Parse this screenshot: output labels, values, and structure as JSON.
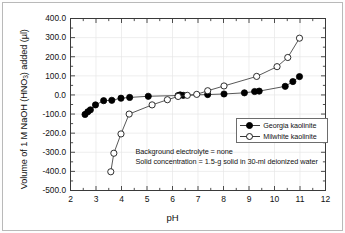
{
  "chart_data": {
    "type": "line",
    "title": "",
    "xlabel": "pH",
    "ylabel": "Volume of 1 M NaOH (HNO3) added (µl)",
    "ylabel_parts": {
      "pre": "Volume of 1 M NaOH (HNO",
      "sub": "3",
      "post": ") added (µl)"
    },
    "xlim": [
      2,
      12
    ],
    "ylim": [
      -500,
      400
    ],
    "xticks": [
      "2",
      "3",
      "4",
      "5",
      "6",
      "7",
      "8",
      "9",
      "10",
      "11",
      "12"
    ],
    "yticks": [
      "400.0",
      "300.0",
      "200.0",
      "100.0",
      "0.0",
      "-100.0",
      "-200.0",
      "-300.0",
      "-400.0",
      "-500.0"
    ],
    "grid": true,
    "legend_position": "center-right",
    "series": [
      {
        "name": "Georgia kaolinite",
        "marker": "filled-circle",
        "color": "#000000",
        "points": [
          [
            2.57,
            -102.0
          ],
          [
            2.68,
            -88.0
          ],
          [
            2.78,
            -78.0
          ],
          [
            2.98,
            -52.0
          ],
          [
            3.3,
            -30.0
          ],
          [
            3.62,
            -28.0
          ],
          [
            3.98,
            -17.0
          ],
          [
            4.32,
            -13.0
          ],
          [
            5.05,
            -7.0
          ],
          [
            6.22,
            -3.0
          ],
          [
            6.3,
            0.0
          ],
          [
            6.42,
            -2.0
          ],
          [
            7.38,
            2.0
          ],
          [
            8.02,
            5.0
          ],
          [
            8.82,
            11.0
          ],
          [
            9.22,
            18.0
          ],
          [
            9.4,
            20.0
          ],
          [
            10.42,
            45.0
          ],
          [
            10.72,
            70.0
          ],
          [
            10.98,
            96.0
          ]
        ]
      },
      {
        "name": "Milwhite kaolinite",
        "marker": "open-circle",
        "color": "#1a1a1a",
        "points": [
          [
            3.58,
            -402.0
          ],
          [
            3.7,
            -305.0
          ],
          [
            3.98,
            -204.0
          ],
          [
            4.3,
            -100.0
          ],
          [
            5.2,
            -52.0
          ],
          [
            5.8,
            -25.0
          ],
          [
            6.22,
            -8.0
          ],
          [
            6.58,
            -2.0
          ],
          [
            6.95,
            3.0
          ],
          [
            7.38,
            22.0
          ],
          [
            8.02,
            47.0
          ],
          [
            9.3,
            97.0
          ],
          [
            10.1,
            148.0
          ],
          [
            10.52,
            196.0
          ],
          [
            10.98,
            297.0
          ]
        ]
      }
    ],
    "annotations": [
      "Background electrolyte = none",
      "Solid concentration = 1.5-g solid in 30-ml deionized water"
    ]
  },
  "legend": {
    "items": [
      {
        "label": "Georgia kaolinite",
        "marker": "filled-circle"
      },
      {
        "label": "Milwhite kaolinite",
        "marker": "open-circle"
      }
    ]
  }
}
